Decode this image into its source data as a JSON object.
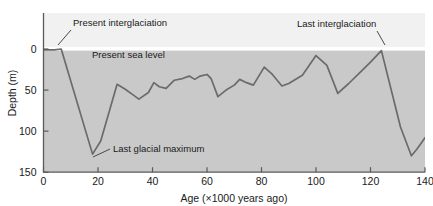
{
  "chart_data": {
    "type": "line",
    "title": "",
    "xlabel": "Age (×1000 years ago)",
    "ylabel": "Depth (m)",
    "xlim": [
      0,
      140
    ],
    "ylim": [
      150,
      0
    ],
    "y_inverted": true,
    "grid": false,
    "legend": null,
    "xticks": [
      "0",
      "20",
      "40",
      "60",
      "80",
      "100",
      "120",
      "140"
    ],
    "xtick_values": [
      0,
      20,
      40,
      60,
      80,
      100,
      120,
      140
    ],
    "yticks": [
      "0",
      "50",
      "100",
      "150"
    ],
    "ytick_values": [
      0,
      50,
      100,
      150
    ],
    "series": [
      {
        "name": "Sea level depth",
        "x": [
          0,
          4,
          6.5,
          18,
          21,
          27,
          30,
          32.5,
          35,
          38.5,
          40.5,
          42.5,
          45,
          48,
          51,
          53.5,
          55.5,
          57.5,
          60,
          61.5,
          64,
          67,
          70,
          72,
          74.5,
          77,
          81,
          84,
          87.5,
          90,
          95,
          100,
          104,
          108,
          112,
          116,
          120,
          124,
          128,
          131,
          135,
          137,
          140
        ],
        "y": [
          1,
          1,
          0,
          128,
          112,
          43,
          49,
          55,
          61,
          53,
          41,
          46,
          48,
          38,
          36,
          33,
          37,
          33,
          31,
          36,
          58,
          50,
          44,
          37,
          41,
          44,
          22,
          31,
          45,
          42,
          32,
          8,
          20,
          54,
          42,
          29,
          16,
          2,
          55,
          95,
          130,
          122,
          108
        ]
      }
    ],
    "annotations": [
      {
        "text": "Present interglaciation",
        "target_x": 5.5,
        "target_y": 4
      },
      {
        "text": "Present sea level",
        "target_x": 30,
        "target_y": 0
      },
      {
        "text": "Last glacial maximum",
        "target_x": 18.5,
        "target_y": 126
      },
      {
        "text": "Last interglaciation",
        "target_x": 124,
        "target_y": 1
      }
    ],
    "colors": {
      "above_sea_fill": "#f1f1f1",
      "below_sea_fill": "#c9c9c9",
      "curve": "#6b6b6b",
      "sea_level_line": "#ffffff",
      "axis": "#5a5a5a",
      "text": "#1a1a1a"
    }
  },
  "labels": {
    "x_axis": "Age (×1000 years ago)",
    "y_axis": "Depth (m)",
    "present_interglaciation": "Present interglaciation",
    "present_sea_level": "Present sea level",
    "last_glacial_maximum": "Last glacial maximum",
    "last_interglaciation": "Last interglaciation"
  }
}
